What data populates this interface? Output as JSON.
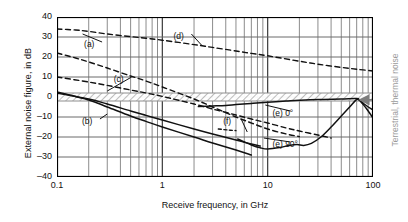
{
  "chart_data": {
    "type": "line",
    "title": "",
    "xlabel": "Receive frequency, in GHz",
    "ylabel": "External noise figure, in dB",
    "xscale": "log",
    "xlim": [
      0.1,
      100
    ],
    "ylim": [
      -40,
      40
    ],
    "grid": true,
    "xticks": [
      "0.1",
      "1",
      "10",
      "100"
    ],
    "xtick_values": [
      0.1,
      1,
      10,
      100
    ],
    "yticks": [
      "40",
      "30",
      "20",
      "10",
      "0",
      "–10",
      "–20",
      "–30",
      "–40"
    ],
    "ytick_values": [
      40,
      30,
      20,
      10,
      0,
      -10,
      -20,
      -30,
      -40
    ],
    "right_annotation": "Terrestrial, thermal noise",
    "band": {
      "label": "thermal-noise-band",
      "y_low": -2,
      "y_high": 2,
      "x_start": 0.1,
      "x_end": 100,
      "hatch": true,
      "color": "#9a9a9a"
    },
    "series": [
      {
        "name": "(a)",
        "style": "dashed",
        "label": "(a)",
        "label_x": 0.22,
        "label_y": 26,
        "leader_to": [
          0.175,
          31.5
        ],
        "points": [
          [
            0.1,
            34
          ],
          [
            0.15,
            33.5
          ],
          [
            0.2,
            32.8
          ],
          [
            0.3,
            31.5
          ],
          [
            0.5,
            30.2
          ],
          [
            0.7,
            29.4
          ],
          [
            1,
            28.4
          ],
          [
            2,
            26.2
          ],
          [
            3,
            24.8
          ],
          [
            5,
            23.0
          ],
          [
            7,
            21.8
          ],
          [
            10,
            20.6
          ],
          [
            20,
            17.9
          ],
          [
            30,
            16.4
          ],
          [
            50,
            14.8
          ],
          [
            70,
            13.9
          ],
          [
            100,
            13.0
          ]
        ]
      },
      {
        "name": "(b)",
        "style": "solid",
        "label": "(b)",
        "label_x": 0.21,
        "label_y": -12.5,
        "leader_to": [
          0.3,
          -8.5
        ],
        "points": [
          [
            0.1,
            2.5
          ],
          [
            0.2,
            -1.5
          ],
          [
            0.3,
            -5.0
          ],
          [
            0.5,
            -9.5
          ],
          [
            0.7,
            -12.2
          ],
          [
            1,
            -15.0
          ],
          [
            2,
            -20.0
          ],
          [
            3,
            -23.0
          ],
          [
            5,
            -26.5
          ],
          [
            7,
            -29.0
          ]
        ]
      },
      {
        "name": "(c)",
        "style": "dashed",
        "label": "(c)",
        "label_x": 0.42,
        "label_y": 8.5,
        "leader_to": [
          0.3,
          3.0
        ],
        "points": [
          [
            0.1,
            22.0
          ],
          [
            0.15,
            19.5
          ],
          [
            0.2,
            17.5
          ],
          [
            0.3,
            14.5
          ],
          [
            0.5,
            10.5
          ],
          [
            0.7,
            8.0
          ],
          [
            1,
            5.0
          ],
          [
            2,
            -1.0
          ],
          [
            3,
            -5.0
          ],
          [
            5,
            -10.0
          ],
          [
            7,
            -13.0
          ],
          [
            10,
            -16.0
          ],
          [
            15,
            -18.5
          ],
          [
            20,
            -19.8
          ]
        ]
      },
      {
        "name": "(d)",
        "style": "dashed",
        "label": "(d)",
        "label_x": 1.55,
        "label_y": 30,
        "leader_to": [
          2.4,
          25.5
        ],
        "points": [
          [
            0.1,
            10.0
          ],
          [
            0.2,
            7.5
          ],
          [
            0.3,
            5.8
          ],
          [
            0.5,
            3.5
          ],
          [
            0.7,
            2.0
          ],
          [
            1,
            0.3
          ],
          [
            2,
            -3.5
          ],
          [
            3,
            -6.0
          ],
          [
            5,
            -9.0
          ],
          [
            7,
            -11.0
          ],
          [
            10,
            -13.0
          ],
          [
            15,
            -15.5
          ],
          [
            20,
            -17.0
          ],
          [
            30,
            -19.0
          ],
          [
            40,
            -20.5
          ]
        ]
      },
      {
        "name": "(e) 0°",
        "style": "solid",
        "label": "(e)",
        "suffix": "0°",
        "label_x": 13.5,
        "label_y": -8.5,
        "leader_to": [
          9.5,
          -4.0
        ],
        "points": [
          [
            2.2,
            -4.8
          ],
          [
            3,
            -4.5
          ],
          [
            4,
            -4.2
          ],
          [
            5,
            -3.8
          ],
          [
            7,
            -3.2
          ],
          [
            10,
            -2.6
          ],
          [
            15,
            -2.0
          ],
          [
            20,
            -1.6
          ],
          [
            30,
            -1.2
          ],
          [
            50,
            -1.0
          ],
          [
            70,
            -0.8
          ],
          [
            75,
            -1.6
          ],
          [
            85,
            -4.0
          ],
          [
            100,
            -6.5
          ]
        ]
      },
      {
        "name": "(e) 90°",
        "style": "solid",
        "label": "(e)",
        "suffix": "90°",
        "label_x": 13.5,
        "label_y": -24,
        "leader_to": [
          9.2,
          -20.5
        ],
        "points": [
          [
            5.2,
            -21.0
          ],
          [
            6,
            -22.5
          ],
          [
            7,
            -24.0
          ],
          [
            8.5,
            -25.4
          ],
          [
            10,
            -26.0
          ],
          [
            13,
            -25.3
          ],
          [
            16,
            -24.2
          ],
          [
            19,
            -23.8
          ],
          [
            22,
            -24.2
          ],
          [
            26,
            -23.2
          ],
          [
            32,
            -20.0
          ],
          [
            40,
            -15.0
          ],
          [
            50,
            -9.5
          ],
          [
            60,
            -5.0
          ],
          [
            68,
            -1.8
          ],
          [
            72,
            -1.2
          ],
          [
            80,
            -3.5
          ],
          [
            90,
            -7.0
          ],
          [
            100,
            -10.5
          ]
        ]
      },
      {
        "name": "(f)",
        "style": "solid",
        "label": "(f)",
        "label_x": 4.6,
        "label_y": -12.5,
        "leader_to": [
          6.4,
          -17.5
        ],
        "points": [
          [
            0.1,
            2.0
          ],
          [
            0.2,
            -1.0
          ],
          [
            0.3,
            -3.5
          ],
          [
            0.5,
            -7.0
          ],
          [
            0.7,
            -9.2
          ],
          [
            1,
            -11.5
          ],
          [
            2,
            -16.0
          ],
          [
            3,
            -18.5
          ],
          [
            5,
            -21.5
          ],
          [
            7,
            -23.5
          ],
          [
            8.5,
            -24.5
          ]
        ]
      },
      {
        "name": "(f)-tail",
        "style": "dashed-short",
        "label": "",
        "points": [
          [
            3.4,
            -16.0
          ],
          [
            4.2,
            -16.5
          ],
          [
            5.0,
            -16.8
          ]
        ]
      }
    ],
    "arrow": {
      "name": "convergence-arrow",
      "x_from": 100,
      "x_to": 72,
      "y": -1.4
    }
  }
}
